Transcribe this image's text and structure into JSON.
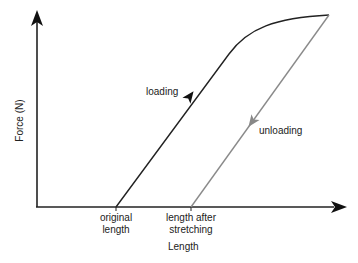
{
  "diagram": {
    "axes": {
      "x_label": "Length",
      "y_label": "Force (N)"
    },
    "x_ticks": {
      "original": "original\nlength",
      "original_line1": "original",
      "original_line2": "length",
      "after_line1": "length after",
      "after_line2": "stretching"
    },
    "curves": {
      "loading": {
        "label": "loading",
        "color": "#222222"
      },
      "unloading": {
        "label": "unloading",
        "color": "#8a8a8a"
      }
    }
  }
}
